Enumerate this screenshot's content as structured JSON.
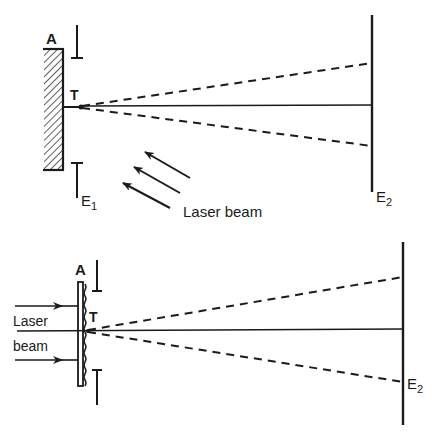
{
  "figure": {
    "top_panel": {
      "description": "Reflection hologram recording: laser beam incident obliquely on object plate, light scattered from point T toward screen E2",
      "labels": {
        "aperture": "A",
        "point": "T",
        "screen_near": "E",
        "screen_near_sub": "1",
        "screen_far": "E",
        "screen_far_sub": "2",
        "beam": "Laser beam"
      },
      "rays": [
        "central-solid",
        "upper-dashed",
        "lower-dashed"
      ]
    },
    "bottom_panel": {
      "description": "Transmission configuration: laser beam incident from left through corrugated plate, light diffracted from point T to screen E2",
      "labels": {
        "aperture": "A",
        "point": "T",
        "beam_line1": "Laser",
        "beam_line2": "beam",
        "screen_far": "E",
        "screen_far_sub": "2"
      },
      "rays": [
        "central-solid",
        "upper-dashed",
        "lower-dashed"
      ]
    },
    "colors": {
      "ink": "#1a1a1a",
      "background": "#ffffff"
    }
  }
}
